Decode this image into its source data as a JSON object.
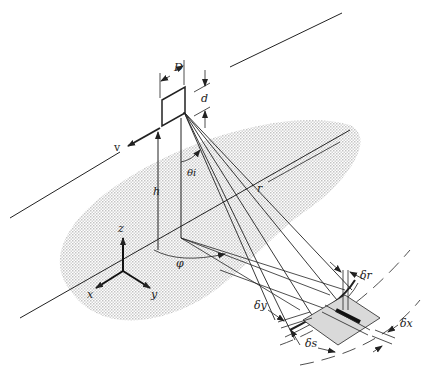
{
  "diagram": {
    "type": "side-looking radar imaging geometry",
    "colors": {
      "ink": "#222222",
      "ground_stipple": "#cfcfcf",
      "resolution_cell": "#d9d9d9"
    },
    "labels": {
      "antenna_length": "D",
      "antenna_height": "d",
      "velocity": "v",
      "altitude": "h",
      "incidence_angle": "θi",
      "slant_range": "r",
      "azimuth_angle": "φ",
      "axis_z": "z",
      "axis_x": "x",
      "axis_y": "y",
      "range_resolution": "δr",
      "ground_range_resolution": "δy",
      "arc_resolution": "δs",
      "azimuth_resolution": "δx"
    }
  }
}
